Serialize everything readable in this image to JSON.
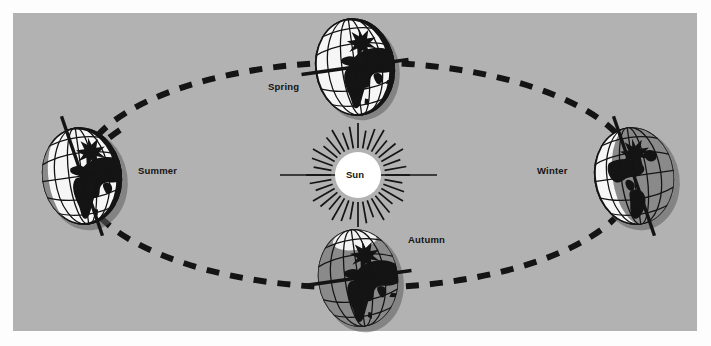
{
  "diagram": {
    "background_color": "#b2b2b2",
    "page_color": "#fdfdfd",
    "ink_color": "#141414",
    "sun_color": "#ffffff",
    "shadow_color": "#7a7a7a"
  },
  "center": {
    "label": "Sun",
    "x": 358,
    "y": 175,
    "radius": 23
  },
  "orbit": {
    "type": "ellipse",
    "center_x": 358,
    "center_y": 175,
    "radius_x": 278,
    "radius_y": 113,
    "style": "dashed",
    "direction": "counter-clockwise",
    "arrow_count": 4
  },
  "positions": [
    {
      "id": "spring",
      "label": "Spring",
      "globe_x": 355,
      "globe_y": 67,
      "globe_rx": 40,
      "globe_ry": 49,
      "shade": "none",
      "label_x": 268,
      "label_y": 86
    },
    {
      "id": "summer",
      "label": "Summer",
      "globe_x": 82,
      "globe_y": 176,
      "globe_rx": 41,
      "globe_ry": 50,
      "shade": "left",
      "label_x": 138,
      "label_y": 170
    },
    {
      "id": "autumn",
      "label": "Autumn",
      "globe_x": 358,
      "globe_y": 278,
      "globe_rx": 41,
      "globe_ry": 50,
      "shade": "full",
      "label_x": 408,
      "label_y": 239
    },
    {
      "id": "winter",
      "label": "Winter",
      "globe_x": 634,
      "globe_y": 176,
      "globe_rx": 41,
      "globe_ry": 50,
      "shade": "right",
      "label_x": 537,
      "label_y": 170
    }
  ],
  "axis_line": {
    "name": "sun-horizontal-axis",
    "x1": 280,
    "x2": 437,
    "y": 175
  },
  "rays": {
    "count": 36,
    "inner_radius": 27,
    "outer_radius": 52
  }
}
